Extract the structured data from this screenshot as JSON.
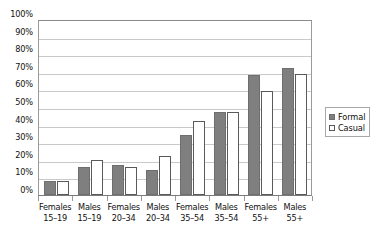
{
  "chart_data": {
    "type": "bar",
    "title": "",
    "xlabel": "",
    "ylabel": "",
    "ylim": [
      0,
      100
    ],
    "ytick_labels": [
      "100%",
      "90%",
      "80%",
      "70%",
      "60%",
      "50%",
      "40%",
      "30%",
      "20%",
      "10%",
      "0%"
    ],
    "ytick_values": [
      100,
      90,
      80,
      70,
      60,
      50,
      40,
      30,
      20,
      10,
      0
    ],
    "grid": true,
    "legend_position": "right",
    "categories": [
      {
        "line1": "Females",
        "line2": "15–19"
      },
      {
        "line1": "Males",
        "line2": "15–19"
      },
      {
        "line1": "Females",
        "line2": "20–34"
      },
      {
        "line1": "Males",
        "line2": "20–34"
      },
      {
        "line1": "Females",
        "line2": "35–54"
      },
      {
        "line1": "Males",
        "line2": "35–54"
      },
      {
        "line1": "Females",
        "line2": "55+"
      },
      {
        "line1": "Males",
        "line2": "55+"
      }
    ],
    "series": [
      {
        "name": "Formal",
        "color": "#7f7f7f",
        "style": "filled",
        "values": [
          8,
          16,
          17,
          14,
          34,
          47,
          68,
          72
        ]
      },
      {
        "name": "Casual",
        "color": "#ffffff",
        "style": "outlined",
        "values": [
          8,
          20,
          16,
          22,
          42,
          47,
          59,
          69
        ]
      }
    ]
  },
  "legend": {
    "entries": [
      {
        "label": "Formal",
        "marker": "filled-square-icon"
      },
      {
        "label": "Casual",
        "marker": "outlined-square-icon"
      }
    ]
  }
}
